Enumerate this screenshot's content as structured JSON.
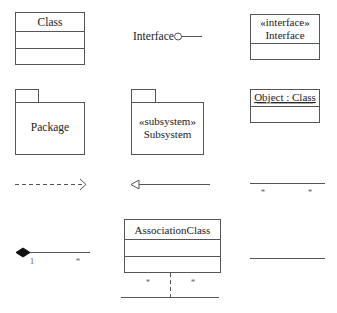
{
  "diagram": {
    "stroke_color": "#555555",
    "text_color": "#222222",
    "class": {
      "name": "Class"
    },
    "interface_lollipop": {
      "label": "Interface"
    },
    "interface_box": {
      "stereotype": "«interface»",
      "name": "Interface"
    },
    "package": {
      "name": "Package"
    },
    "subsystem": {
      "stereotype": "«subsystem»",
      "name": "Subsystem"
    },
    "object": {
      "name": "Object : Class"
    },
    "dependency": {
      "type": "dashed-open-arrow"
    },
    "generalization": {
      "type": "hollow-triangle-arrow"
    },
    "association_many": {
      "left_mult": "*",
      "right_mult": "*"
    },
    "composition": {
      "left_mult": "1",
      "right_mult": "*"
    },
    "association_class": {
      "name": "AssociationClass",
      "left_mult": "*",
      "right_mult": "*"
    },
    "association": {
      "type": "plain-line"
    }
  }
}
